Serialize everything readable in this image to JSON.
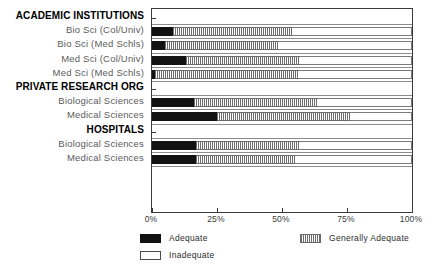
{
  "chart_data": {
    "type": "bar",
    "orientation": "horizontal",
    "stacked": true,
    "stacked_percent": true,
    "title": "",
    "xlabel": "",
    "ylabel": "",
    "xlim": [
      0,
      100
    ],
    "xticks": [
      0,
      25,
      50,
      75,
      100
    ],
    "xtick_labels": [
      "0%",
      "25%",
      "50%",
      "75%",
      "100%"
    ],
    "grid": false,
    "legend_position": "bottom",
    "legend": [
      "Adequate",
      "Generally Adequate",
      "Inadequate"
    ],
    "series": [
      {
        "name": "Adequate",
        "values": [
          8,
          5,
          13,
          1,
          16,
          25,
          17,
          17
        ]
      },
      {
        "name": "Generally Adequate",
        "values": [
          46,
          44,
          44,
          55,
          48,
          51,
          40,
          38
        ]
      },
      {
        "name": "Inadequate",
        "values": [
          46,
          51,
          43,
          44,
          36,
          24,
          43,
          45
        ]
      }
    ],
    "groups": [
      {
        "label": "ACADEMIC INSTITUTIONS",
        "categories": [
          "Bio Sci (Col/Univ)",
          "Bio Sci (Med Schls)",
          "Med Sci (Col/Univ)",
          "Med Sci (Med Schls)"
        ]
      },
      {
        "label": "PRIVATE RESEARCH ORG",
        "categories": [
          "Biological Sciences",
          "Medical Sciences"
        ]
      },
      {
        "label": "HOSPITALS",
        "categories": [
          "Biological Sciences",
          "Medical Sciences"
        ]
      }
    ],
    "categories": [
      "Bio Sci (Col/Univ)",
      "Bio Sci (Med Schls)",
      "Med Sci (Col/Univ)",
      "Med Sci (Med Schls)",
      "Biological Sciences",
      "Medical Sciences",
      "Biological Sciences",
      "Medical Sciences"
    ],
    "colors": {
      "adequate": "#121212",
      "generally_adequate": "#6e6e6e",
      "inadequate": "#ffffff",
      "axis": "#3a3a3a"
    }
  },
  "axis": {
    "ticks": [
      {
        "label": "0%",
        "value": 0
      },
      {
        "label": "25%",
        "value": 25
      },
      {
        "label": "50%",
        "value": 50
      },
      {
        "label": "75%",
        "value": 75
      },
      {
        "label": "100%",
        "value": 100
      }
    ]
  },
  "rows": [
    {
      "kind": "group",
      "label": "ACADEMIC INSTITUTIONS"
    },
    {
      "kind": "bar",
      "label": "Bio Sci (Col/Univ)",
      "adequate": 8,
      "generally": 46,
      "inadequate": 46
    },
    {
      "kind": "bar",
      "label": "Bio Sci (Med Schls)",
      "adequate": 5,
      "generally": 44,
      "inadequate": 51
    },
    {
      "kind": "bar",
      "label": "Med Sci (Col/Univ)",
      "adequate": 13,
      "generally": 44,
      "inadequate": 43
    },
    {
      "kind": "bar",
      "label": "Med Sci (Med Schls)",
      "adequate": 1,
      "generally": 55,
      "inadequate": 44
    },
    {
      "kind": "group",
      "label": "PRIVATE RESEARCH ORG"
    },
    {
      "kind": "bar",
      "label": "Biological Sciences",
      "adequate": 16,
      "generally": 48,
      "inadequate": 36
    },
    {
      "kind": "bar",
      "label": "Medical Sciences",
      "adequate": 25,
      "generally": 51,
      "inadequate": 24
    },
    {
      "kind": "group",
      "label": "HOSPITALS"
    },
    {
      "kind": "bar",
      "label": "Biological Sciences",
      "adequate": 17,
      "generally": 40,
      "inadequate": 43
    },
    {
      "kind": "bar",
      "label": "Medical Sciences",
      "adequate": 17,
      "generally": 38,
      "inadequate": 45
    }
  ],
  "legend": {
    "items": [
      {
        "label": "Adequate",
        "swatch": "adequate"
      },
      {
        "label": "Generally Adequate",
        "swatch": "generally"
      },
      {
        "label": "Inadequate",
        "swatch": "inadequate"
      }
    ]
  }
}
